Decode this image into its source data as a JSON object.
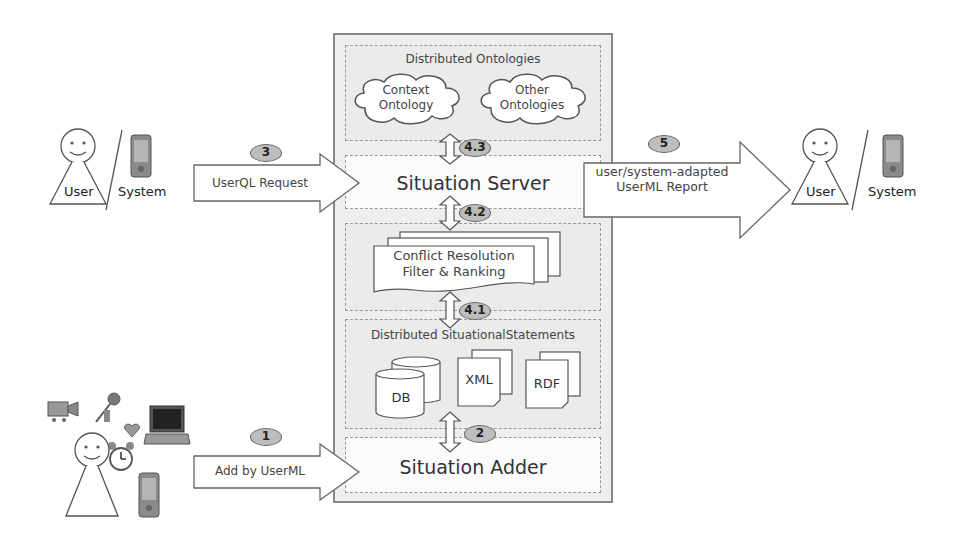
{
  "diagram": {
    "server_box": {
      "ontologies": {
        "title": "Distributed Ontologies",
        "clouds": [
          {
            "label_line1": "Context",
            "label_line2": "Ontology"
          },
          {
            "label_line1": "Other",
            "label_line2": "Ontologies"
          }
        ]
      },
      "situation_server": {
        "title": "Situation Server"
      },
      "conflict": {
        "label_line1": "Conflict Resolution",
        "label_line2": "Filter & Ranking"
      },
      "statements": {
        "title": "Distributed SituationalStatements",
        "stores": [
          {
            "label": "DB",
            "shape": "database-cylinder"
          },
          {
            "label": "XML",
            "shape": "document-stack"
          },
          {
            "label": "RDF",
            "shape": "document-stack"
          }
        ]
      },
      "situation_adder": {
        "title": "Situation Adder"
      }
    },
    "badges": {
      "b1": "1",
      "b2": "2",
      "b3": "3",
      "b41": "4.1",
      "b42": "4.2",
      "b43": "4.3",
      "b5": "5"
    },
    "arrows": {
      "request": {
        "label": "UserQL Request"
      },
      "report": {
        "label_line1": "user/system-adapted",
        "label_line2": "UserML Report"
      },
      "add": {
        "label": "Add by UserML"
      }
    },
    "actors": {
      "left_top": {
        "user_label": "User",
        "system_label": "System",
        "separator": "/"
      },
      "right_top": {
        "user_label": "User",
        "system_label": "System",
        "separator": "/"
      },
      "bottom_left": {
        "icons": [
          "video-camera-icon",
          "microphone-icon",
          "heart-icon",
          "laptop-icon",
          "alarm-clock-icon",
          "pda-device-icon",
          "user-stick-figure"
        ]
      }
    },
    "colors": {
      "outer_background": "#eeeeee",
      "badge_fill": "#bdbdbd",
      "border": "#888888"
    }
  }
}
